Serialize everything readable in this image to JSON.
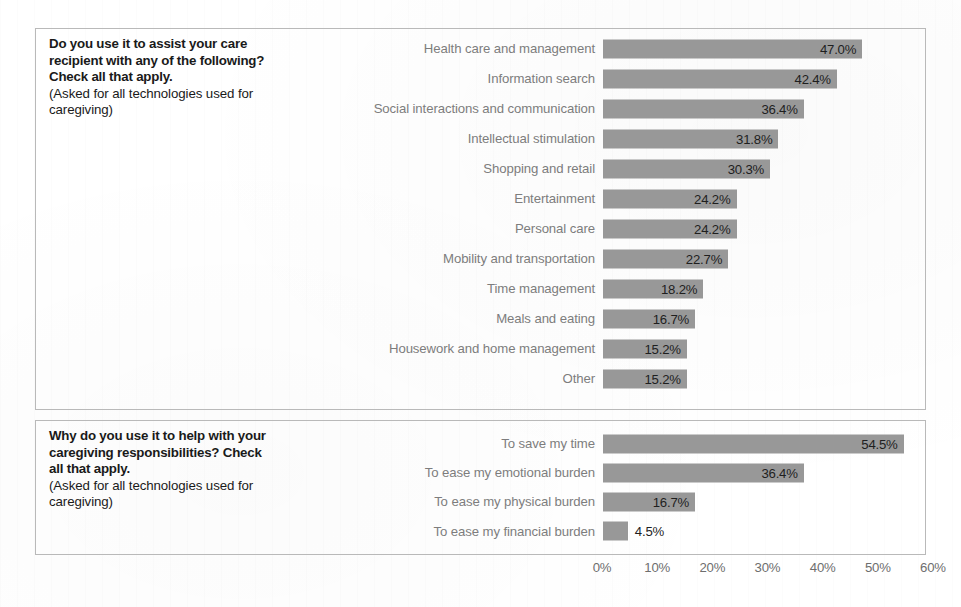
{
  "figure": {
    "bar_color": "#989898",
    "panel_border_color": "#b9b9b9",
    "label_color": "#7d7d7d",
    "value_color": "#1f1f1f"
  },
  "panels": [
    {
      "id": "panel-usage",
      "prompt_main": "Do you use it to assist your care recipient with any of the following? Check all that apply.",
      "prompt_sub": "(Asked for all technologies used for caregiving)"
    },
    {
      "id": "panel-reasons",
      "prompt_main": "Why do you use it to help with your caregiving responsibilities? Check all that apply.",
      "prompt_sub": "(Asked for all technologies used for caregiving)"
    }
  ],
  "axis": {
    "ticks": [
      "0%",
      "10%",
      "20%",
      "30%",
      "40%",
      "50%",
      "60%"
    ],
    "tick_values": [
      0,
      10,
      20,
      30,
      40,
      50,
      60
    ]
  },
  "chart_data": [
    {
      "type": "bar",
      "orientation": "horizontal",
      "title": "Do you use it to assist your care recipient with any of the following? Check all that apply.",
      "subtitle": "(Asked for all technologies used for caregiving)",
      "xlabel": "",
      "ylabel": "",
      "xlim": [
        0,
        60
      ],
      "grid": false,
      "categories": [
        "Health care and management",
        "Information search",
        "Social interactions and communication",
        "Intellectual stimulation",
        "Shopping and retail",
        "Entertainment",
        "Personal care",
        "Mobility and transportation",
        "Time management",
        "Meals and eating",
        "Housework and home management",
        "Other"
      ],
      "values": [
        47.0,
        42.4,
        36.4,
        31.8,
        30.3,
        24.2,
        24.2,
        22.7,
        18.2,
        16.7,
        15.2,
        15.2
      ],
      "labels": [
        "47.0%",
        "42.4%",
        "36.4%",
        "31.8%",
        "30.3%",
        "24.2%",
        "24.2%",
        "22.7%",
        "18.2%",
        "16.7%",
        "15.2%",
        "15.2%"
      ],
      "label_position": [
        "inside",
        "inside",
        "inside",
        "inside",
        "inside",
        "inside",
        "inside",
        "inside",
        "inside",
        "inside",
        "inside",
        "inside"
      ]
    },
    {
      "type": "bar",
      "orientation": "horizontal",
      "title": "Why do you use it to help with your caregiving responsibilities? Check all that apply.",
      "subtitle": "(Asked for all technologies used for caregiving)",
      "xlabel": "",
      "ylabel": "",
      "xlim": [
        0,
        60
      ],
      "grid": false,
      "categories": [
        "To save my time",
        "To ease my emotional burden",
        "To ease my physical burden",
        "To ease my financial burden"
      ],
      "values": [
        54.5,
        36.4,
        16.7,
        4.5
      ],
      "labels": [
        "54.5%",
        "36.4%",
        "16.7%",
        "4.5%"
      ],
      "label_position": [
        "inside",
        "inside",
        "inside",
        "outside"
      ]
    }
  ]
}
